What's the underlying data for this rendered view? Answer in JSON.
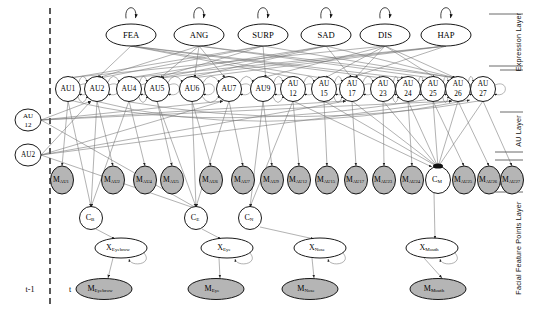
{
  "diagram": {
    "time_slices": {
      "previous": "t-1",
      "current": "t"
    },
    "layer_labels": {
      "expression": "Expression Layer",
      "au": "AU Layer",
      "feature_points": "Facial Feature Points Layer"
    },
    "colors": {
      "node_stroke": "#000000",
      "node_fill_white": "#ffffff",
      "measurement_fill": "#b5b5b5",
      "edge": "#555555",
      "divider": "#000000"
    },
    "expression_nodes": [
      {
        "label": "FEA",
        "x": 131,
        "y": 35
      },
      {
        "label": "ANG",
        "x": 199,
        "y": 35
      },
      {
        "label": "SURP",
        "x": 263,
        "y": 35
      },
      {
        "label": "SAD",
        "x": 326,
        "y": 35
      },
      {
        "label": "DIS",
        "x": 385,
        "y": 35
      },
      {
        "label": "HAP",
        "x": 446,
        "y": 35
      }
    ],
    "au_nodes": [
      {
        "label": "AU1",
        "line1": "AU1",
        "line2": "",
        "x": 68,
        "y": 89
      },
      {
        "label": "AU2",
        "line1": "AU2",
        "line2": "",
        "x": 97,
        "y": 89
      },
      {
        "label": "AU4",
        "line1": "AU4",
        "line2": "",
        "x": 129,
        "y": 89
      },
      {
        "label": "AU5",
        "line1": "AU5",
        "line2": "",
        "x": 157,
        "y": 89
      },
      {
        "label": "AU6",
        "line1": "AU6",
        "line2": "",
        "x": 192,
        "y": 89
      },
      {
        "label": "AU7",
        "line1": "AU7",
        "line2": "",
        "x": 229,
        "y": 89
      },
      {
        "label": "AU9",
        "line1": "AU9",
        "line2": "",
        "x": 263,
        "y": 89
      },
      {
        "label": "AU12",
        "line1": "AU",
        "line2": "12",
        "x": 293,
        "y": 89
      },
      {
        "label": "AU15",
        "line1": "AU",
        "line2": "15",
        "x": 324,
        "y": 89
      },
      {
        "label": "AU17",
        "line1": "AU",
        "line2": "17",
        "x": 352,
        "y": 89
      },
      {
        "label": "AU23",
        "line1": "AU",
        "line2": "23",
        "x": 383,
        "y": 89
      },
      {
        "label": "AU24",
        "line1": "AU",
        "line2": "24",
        "x": 408,
        "y": 89
      },
      {
        "label": "AU25",
        "line1": "AU",
        "line2": "25",
        "x": 433,
        "y": 89
      },
      {
        "label": "AU26",
        "line1": "AU",
        "line2": "26",
        "x": 458,
        "y": 89
      },
      {
        "label": "AU27",
        "line1": "AU",
        "line2": "27",
        "x": 483,
        "y": 89
      }
    ],
    "prev_slice_nodes": [
      {
        "label": "AU12",
        "line1": "AU",
        "line2": "12",
        "x": 28,
        "y": 120
      },
      {
        "label": "AU2",
        "line1": "AU2",
        "line2": "",
        "x": 28,
        "y": 155
      }
    ],
    "measurement_au_nodes": [
      {
        "label": "MAU1",
        "sub": "AU1",
        "x": 62,
        "y": 180
      },
      {
        "label": "MAU2",
        "sub": "AU2",
        "x": 113,
        "y": 180
      },
      {
        "label": "MAU4",
        "sub": "AU4",
        "x": 145,
        "y": 180
      },
      {
        "label": "MAU5",
        "sub": "AU5",
        "x": 172,
        "y": 180
      },
      {
        "label": "MAU6",
        "sub": "AU6",
        "x": 211,
        "y": 180
      },
      {
        "label": "MAU7",
        "sub": "AU7",
        "x": 243,
        "y": 180
      },
      {
        "label": "MAU9",
        "sub": "AU9",
        "x": 272,
        "y": 180
      },
      {
        "label": "MAU12",
        "sub": "AU12",
        "x": 299,
        "y": 180
      },
      {
        "label": "MAU15",
        "sub": "AU15",
        "x": 327,
        "y": 180
      },
      {
        "label": "MAU17",
        "sub": "AU17",
        "x": 356,
        "y": 180
      },
      {
        "label": "MAU23",
        "sub": "AU23",
        "x": 384,
        "y": 180
      },
      {
        "label": "MAU24",
        "sub": "AU24",
        "x": 412,
        "y": 180
      },
      {
        "label": "MAU25",
        "sub": "AU25",
        "x": 464,
        "y": 180
      },
      {
        "label": "MAU26",
        "sub": "AU26",
        "x": 489,
        "y": 180
      },
      {
        "label": "MAU27",
        "sub": "AU27",
        "x": 512,
        "y": 180
      }
    ],
    "cm_node": {
      "label": "CM",
      "sub": "M",
      "x": 438,
      "y": 180
    },
    "component_nodes": [
      {
        "label": "CB",
        "sub": "B",
        "x": 91,
        "y": 218
      },
      {
        "label": "CE",
        "sub": "E",
        "x": 196,
        "y": 218
      },
      {
        "label": "CN",
        "sub": "N",
        "x": 250,
        "y": 218
      }
    ],
    "feature_point_nodes": [
      {
        "label": "XEyebrow",
        "sub": "Eyebrow",
        "x": 121,
        "y": 248
      },
      {
        "label": "XEye",
        "sub": "Eye",
        "x": 227,
        "y": 248
      },
      {
        "label": "XNose",
        "sub": "Nose",
        "x": 320,
        "y": 248
      },
      {
        "label": "XMouth",
        "sub": "Mouth",
        "x": 432,
        "y": 248
      }
    ],
    "measurement_feature_nodes": [
      {
        "label": "MEyebrow",
        "sub": "Eyebrow",
        "x": 104,
        "y": 289
      },
      {
        "label": "MEye",
        "sub": "Eye",
        "x": 216,
        "y": 289
      },
      {
        "label": "MNose",
        "sub": "Nose",
        "x": 310,
        "y": 289
      },
      {
        "label": "MMouth",
        "sub": "Mouth",
        "x": 438,
        "y": 289
      }
    ]
  }
}
